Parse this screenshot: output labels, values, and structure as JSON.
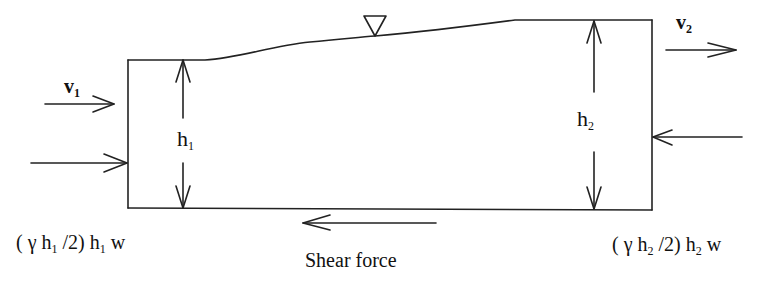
{
  "diagram": {
    "labels": {
      "v1": {
        "base": "v",
        "sub": "1"
      },
      "v2": {
        "base": "v",
        "sub": "2"
      },
      "h1": {
        "base": "h",
        "sub": "1"
      },
      "h2": {
        "base": "h",
        "sub": "2"
      },
      "force_left": {
        "pre": "( γ h",
        "sub1": "1",
        "mid": " /2) h",
        "sub2": "1",
        "post": " w"
      },
      "force_right": {
        "pre": "( γ h",
        "sub1": "2",
        "mid": " /2) h",
        "sub2": "2",
        "post": " w"
      },
      "shear": "Shear force"
    },
    "symbols": [
      "water-surface-triangle"
    ],
    "stroke_color": "#222222"
  }
}
